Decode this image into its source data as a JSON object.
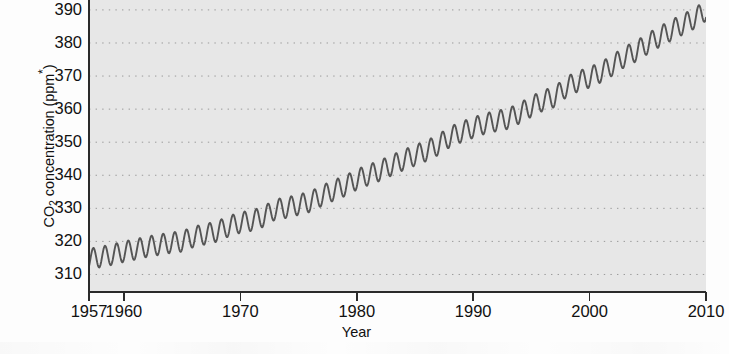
{
  "chart_data": {
    "type": "line",
    "title": "",
    "xlabel": "Year",
    "ylabel": "CO2 concentration (ppm*)",
    "ylabel_parts": {
      "prefix": "CO",
      "subscript": "2",
      "suffix": " concentration (ppm",
      "superscript": "*",
      "tail": ")"
    },
    "xlim": [
      1957,
      2010
    ],
    "ylim": [
      305,
      393
    ],
    "grid": true,
    "grid_style": "dotted",
    "legend": "none",
    "plot_background_color": "#e7e7e7",
    "line_color": "#555555",
    "axis_color": "#2b2b2b",
    "xticks": [
      1957,
      1960,
      1970,
      1980,
      1990,
      2000,
      2010
    ],
    "xtick_labels": [
      "1957",
      "1960",
      "1970",
      "1980",
      "1990",
      "2000",
      "2010"
    ],
    "yticks": [
      310,
      320,
      330,
      340,
      350,
      360,
      370,
      380,
      390
    ],
    "ytick_labels": [
      "310",
      "320",
      "330",
      "340",
      "350",
      "360",
      "370",
      "380",
      "390"
    ],
    "series": [
      {
        "name": "Mauna Loa monthly mean CO2",
        "description": "Keeling Curve: monthly mean atmospheric CO2 with seasonal sawtooth superimposed on rising trend",
        "seasonal_amplitude_ppm": 3.1,
        "seasonal_peak_month": 5,
        "annual_means": [
          {
            "year": 1957,
            "value": 314.7
          },
          {
            "year": 1958,
            "value": 315.3
          },
          {
            "year": 1959,
            "value": 316.0
          },
          {
            "year": 1960,
            "value": 316.9
          },
          {
            "year": 1961,
            "value": 317.6
          },
          {
            "year": 1962,
            "value": 318.4
          },
          {
            "year": 1963,
            "value": 319.0
          },
          {
            "year": 1964,
            "value": 319.6
          },
          {
            "year": 1965,
            "value": 320.0
          },
          {
            "year": 1966,
            "value": 321.4
          },
          {
            "year": 1967,
            "value": 322.2
          },
          {
            "year": 1968,
            "value": 323.0
          },
          {
            "year": 1969,
            "value": 324.6
          },
          {
            "year": 1970,
            "value": 325.7
          },
          {
            "year": 1971,
            "value": 326.3
          },
          {
            "year": 1972,
            "value": 327.5
          },
          {
            "year": 1973,
            "value": 329.7
          },
          {
            "year": 1974,
            "value": 330.2
          },
          {
            "year": 1975,
            "value": 331.1
          },
          {
            "year": 1976,
            "value": 332.0
          },
          {
            "year": 1977,
            "value": 333.8
          },
          {
            "year": 1978,
            "value": 335.4
          },
          {
            "year": 1979,
            "value": 336.8
          },
          {
            "year": 1980,
            "value": 338.7
          },
          {
            "year": 1981,
            "value": 340.1
          },
          {
            "year": 1982,
            "value": 341.4
          },
          {
            "year": 1983,
            "value": 343.0
          },
          {
            "year": 1984,
            "value": 344.6
          },
          {
            "year": 1985,
            "value": 346.0
          },
          {
            "year": 1986,
            "value": 347.4
          },
          {
            "year": 1987,
            "value": 349.2
          },
          {
            "year": 1988,
            "value": 351.6
          },
          {
            "year": 1989,
            "value": 353.1
          },
          {
            "year": 1990,
            "value": 354.4
          },
          {
            "year": 1991,
            "value": 355.6
          },
          {
            "year": 1992,
            "value": 356.4
          },
          {
            "year": 1993,
            "value": 357.1
          },
          {
            "year": 1994,
            "value": 358.8
          },
          {
            "year": 1995,
            "value": 360.8
          },
          {
            "year": 1996,
            "value": 362.6
          },
          {
            "year": 1997,
            "value": 363.7
          },
          {
            "year": 1998,
            "value": 366.7
          },
          {
            "year": 1999,
            "value": 368.4
          },
          {
            "year": 2000,
            "value": 369.6
          },
          {
            "year": 2001,
            "value": 371.2
          },
          {
            "year": 2002,
            "value": 373.3
          },
          {
            "year": 2003,
            "value": 375.8
          },
          {
            "year": 2004,
            "value": 377.5
          },
          {
            "year": 2005,
            "value": 379.8
          },
          {
            "year": 2006,
            "value": 381.9
          },
          {
            "year": 2007,
            "value": 383.8
          },
          {
            "year": 2008,
            "value": 385.6
          },
          {
            "year": 2009,
            "value": 387.4
          },
          {
            "year": 2010,
            "value": 389.8
          }
        ]
      }
    ]
  }
}
